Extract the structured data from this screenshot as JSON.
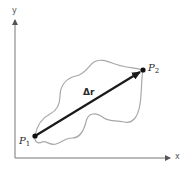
{
  "diagram": {
    "title": "",
    "axes": {
      "x_label": "x",
      "y_label": "y"
    },
    "points": [
      {
        "name": "P",
        "subscript": "1",
        "x": 35,
        "y": 136
      },
      {
        "name": "P",
        "subscript": "2",
        "x": 143,
        "y": 70
      }
    ],
    "vector": {
      "label": "Δr",
      "from": "P1",
      "to": "P2"
    },
    "path": {
      "description": "curved path from P1 to P2"
    },
    "colors": {
      "axis": "#777777",
      "vector": "#1a1a1a",
      "path": "#a8a8a8",
      "point": "#111111"
    }
  }
}
